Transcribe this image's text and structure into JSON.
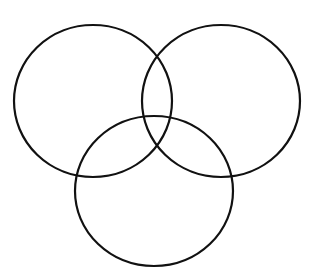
{
  "diagram": {
    "type": "venn",
    "background": "#ffffff",
    "stroke": "#111111",
    "stroke_width": 2.2,
    "circles": [
      {
        "name": "left-circle",
        "cx": 93,
        "cy": 101,
        "rx": 79,
        "ry": 76
      },
      {
        "name": "right-circle",
        "cx": 221,
        "cy": 101,
        "rx": 79,
        "ry": 76
      },
      {
        "name": "bottom-circle",
        "cx": 154,
        "cy": 191,
        "rx": 79,
        "ry": 75
      }
    ]
  }
}
